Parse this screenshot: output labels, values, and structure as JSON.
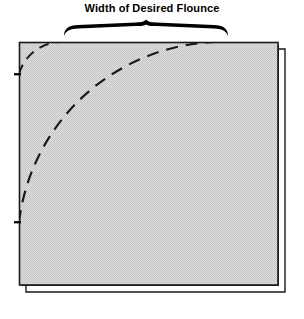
{
  "diagram": {
    "title": "Width of Desired Flounce",
    "type": "sewing-pattern-illustration",
    "colors": {
      "background": "#ffffff",
      "fabric_fill": "#d6d6d6",
      "fabric_texture_dot": "#bdbdbd",
      "outline": "#1a1a1a",
      "dash_line": "#1a1a1a",
      "brace": "#000000",
      "title_text": "#000000"
    },
    "brace": {
      "name": "width-measurement-brace",
      "left_x": 64,
      "right_x": 228,
      "center_x": 146,
      "baseline_y": 36,
      "peak_y": 21
    },
    "fabric": {
      "name": "fabric-panel",
      "left": 19,
      "top": 42,
      "right": 278,
      "bottom": 285,
      "width": 259,
      "height": 243,
      "fold_offset_x": 7,
      "fold_offset_y": 7,
      "description": "shaded rectangular fabric panel with folded double edge on right and bottom"
    },
    "curves": [
      {
        "name": "inner-neckline-arc",
        "label": "small dashed arc near top-left corner",
        "start": [
          19,
          74
        ],
        "end": [
          62,
          42
        ],
        "radius": 44,
        "dash": "10 7",
        "stroke_width": 2
      },
      {
        "name": "flounce-outer-arc",
        "label": "large dashed cutting arc",
        "start": [
          19,
          222
        ],
        "end": [
          215,
          42
        ],
        "radius": 205,
        "dash": "12 8",
        "stroke_width": 2.2
      }
    ]
  }
}
